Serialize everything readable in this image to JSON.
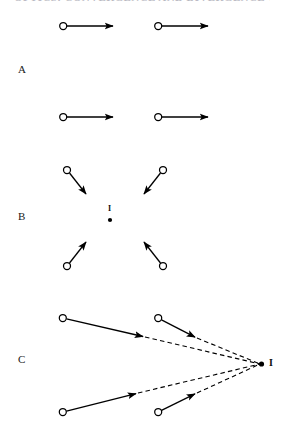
{
  "figure": {
    "width": 284,
    "height": 437,
    "background_color": "#ffffff",
    "stroke_color": "#000000",
    "clipped_header_text": "OPTICS: CONVERGENCE AND DIVERGENCE OF RAYS",
    "panels": [
      {
        "id": "A",
        "label": "A",
        "label_x": 22,
        "label_y": 70,
        "description": "Parallel rays travelling horizontally to the right; no convergence point.",
        "rays": [
          {
            "name": "ray-a-top-left",
            "x1": 62,
            "y1": 26,
            "x2": 115,
            "y2": 26,
            "style": "solid",
            "origin_marker": "open-circle",
            "arrowhead": "filled"
          },
          {
            "name": "ray-a-top-right",
            "x1": 157,
            "y1": 26,
            "x2": 210,
            "y2": 26,
            "style": "solid",
            "origin_marker": "open-circle",
            "arrowhead": "filled"
          },
          {
            "name": "ray-a-bottom-left",
            "x1": 62,
            "y1": 117,
            "x2": 115,
            "y2": 117,
            "style": "solid",
            "origin_marker": "open-circle",
            "arrowhead": "filled"
          },
          {
            "name": "ray-a-bottom-right",
            "x1": 157,
            "y1": 117,
            "x2": 210,
            "y2": 117,
            "style": "solid",
            "origin_marker": "open-circle",
            "arrowhead": "filled"
          }
        ],
        "image_point": null
      },
      {
        "id": "B",
        "label": "B",
        "label_x": 22,
        "label_y": 217,
        "description": "Four rays converging from all four quadrants onto a single real image point I.",
        "rays": [
          {
            "name": "ray-b-top-left",
            "x1": 67,
            "y1": 170,
            "x2": 88,
            "y2": 197,
            "style": "solid",
            "origin_marker": "open-circle",
            "arrowhead": "filled"
          },
          {
            "name": "ray-b-top-right",
            "x1": 163,
            "y1": 170,
            "x2": 142,
            "y2": 197,
            "style": "solid",
            "origin_marker": "open-circle",
            "arrowhead": "filled"
          },
          {
            "name": "ray-b-bottom-left",
            "x1": 67,
            "y1": 266,
            "x2": 88,
            "y2": 239,
            "style": "solid",
            "origin_marker": "open-circle",
            "arrowhead": "filled"
          },
          {
            "name": "ray-b-bottom-right",
            "x1": 163,
            "y1": 266,
            "x2": 142,
            "y2": 239,
            "style": "solid",
            "origin_marker": "open-circle",
            "arrowhead": "filled"
          }
        ],
        "image_point": {
          "name": "image-point-b",
          "label": "I",
          "x": 110,
          "y": 220,
          "label_x": 108,
          "label_y": 208,
          "marker": "filled-dot"
        }
      },
      {
        "id": "C",
        "label": "C",
        "label_x": 22,
        "label_y": 360,
        "description": "Four diverging rays whose dashed backward extensions converge at a virtual image point I on the right.",
        "rays": [
          {
            "name": "ray-c-top-left",
            "x1": 62,
            "y1": 318,
            "x2": 145,
            "y2": 337,
            "style": "solid",
            "origin_marker": "open-circle",
            "arrowhead": "filled"
          },
          {
            "name": "ray-c-top-right",
            "x1": 158,
            "y1": 318,
            "x2": 197,
            "y2": 338,
            "style": "solid",
            "origin_marker": "open-circle",
            "arrowhead": "filled"
          },
          {
            "name": "ray-c-bottom-left",
            "x1": 62,
            "y1": 412,
            "x2": 138,
            "y2": 393,
            "style": "solid",
            "origin_marker": "open-circle",
            "arrowhead": "filled"
          },
          {
            "name": "ray-c-bottom-right",
            "x1": 158,
            "y1": 412,
            "x2": 197,
            "y2": 393,
            "style": "solid",
            "origin_marker": "open-circle",
            "arrowhead": "filled"
          }
        ],
        "virtual_extensions": [
          {
            "name": "dashed-extension-top-left",
            "x1": 145,
            "y1": 337,
            "x2": 261,
            "y2": 364,
            "style": "dashed"
          },
          {
            "name": "dashed-extension-top-right",
            "x1": 197,
            "y1": 338,
            "x2": 261,
            "y2": 364,
            "style": "dashed"
          },
          {
            "name": "dashed-extension-bottom-left",
            "x1": 138,
            "y1": 393,
            "x2": 261,
            "y2": 364,
            "style": "dashed"
          },
          {
            "name": "dashed-extension-bottom-right",
            "x1": 197,
            "y1": 393,
            "x2": 261,
            "y2": 364,
            "style": "dashed"
          }
        ],
        "image_point": {
          "name": "image-point-c",
          "label": "I",
          "x": 262,
          "y": 364,
          "label_x": 270,
          "label_y": 358,
          "marker": "filled-dot"
        }
      }
    ]
  }
}
